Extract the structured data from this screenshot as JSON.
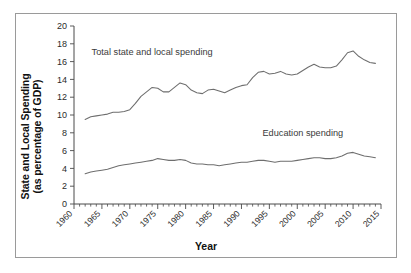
{
  "figure": {
    "frame_color": "#9a9a9a",
    "background": "#ffffff"
  },
  "axes": {
    "y_title_line1": "State and Local Spending",
    "y_title_line2": "(as percentage of GDP)",
    "x_title": "Year"
  },
  "annotations": {
    "total_label": "Total state and local spending",
    "education_label": "Education spending"
  },
  "chart_data": {
    "type": "line",
    "title": "",
    "xlabel": "Year",
    "ylabel": "State and Local Spending (as percentage of GDP)",
    "xlim": [
      1960,
      2015
    ],
    "ylim": [
      0,
      20
    ],
    "ytick_values": [
      0,
      2,
      4,
      6,
      8,
      10,
      12,
      14,
      16,
      18,
      20
    ],
    "ytick_labels": [
      "0",
      "2",
      "4",
      "6",
      "8",
      "10",
      "12",
      "14",
      "16",
      "18",
      "20"
    ],
    "xtick_values": [
      1960,
      1965,
      1970,
      1975,
      1980,
      1985,
      1990,
      1995,
      2000,
      2005,
      2010,
      2015
    ],
    "xtick_labels": [
      "1960",
      "1965",
      "1970",
      "1975",
      "1980",
      "1985",
      "1990",
      "1995",
      "2000",
      "2005",
      "2010",
      "2015"
    ],
    "xtick_rotation": 45,
    "x_minor_tick_step": 1,
    "grid": false,
    "legend": "inline-annotations",
    "line_color": "#6e6e6e",
    "x": [
      1962,
      1963,
      1964,
      1965,
      1966,
      1967,
      1968,
      1969,
      1970,
      1971,
      1972,
      1973,
      1974,
      1975,
      1976,
      1977,
      1978,
      1979,
      1980,
      1981,
      1982,
      1983,
      1984,
      1985,
      1986,
      1987,
      1988,
      1989,
      1990,
      1991,
      1992,
      1993,
      1994,
      1995,
      1996,
      1997,
      1998,
      1999,
      2000,
      2001,
      2002,
      2003,
      2004,
      2005,
      2006,
      2007,
      2008,
      2009,
      2010,
      2011,
      2012,
      2013,
      2014
    ],
    "series": [
      {
        "name": "Total state and local spending",
        "values": [
          9.5,
          9.8,
          9.9,
          10.0,
          10.1,
          10.3,
          10.3,
          10.4,
          10.6,
          11.3,
          12.1,
          12.6,
          13.1,
          13.0,
          12.6,
          12.6,
          13.1,
          13.6,
          13.4,
          12.8,
          12.5,
          12.4,
          12.8,
          12.9,
          12.7,
          12.5,
          12.8,
          13.1,
          13.3,
          13.4,
          14.2,
          14.8,
          14.9,
          14.6,
          14.7,
          14.9,
          14.6,
          14.5,
          14.6,
          15.0,
          15.4,
          15.7,
          15.4,
          15.3,
          15.3,
          15.5,
          16.2,
          17.0,
          17.2,
          16.6,
          16.2,
          15.9,
          15.8
        ]
      },
      {
        "name": "Education spending",
        "values": [
          3.4,
          3.6,
          3.7,
          3.8,
          3.9,
          4.1,
          4.3,
          4.4,
          4.5,
          4.6,
          4.7,
          4.8,
          4.9,
          5.1,
          5.0,
          4.9,
          4.9,
          5.0,
          4.9,
          4.6,
          4.5,
          4.5,
          4.4,
          4.4,
          4.3,
          4.4,
          4.5,
          4.6,
          4.7,
          4.7,
          4.8,
          4.9,
          4.9,
          4.8,
          4.7,
          4.8,
          4.8,
          4.8,
          4.9,
          5.0,
          5.1,
          5.2,
          5.2,
          5.1,
          5.1,
          5.2,
          5.4,
          5.7,
          5.8,
          5.6,
          5.4,
          5.3,
          5.2
        ]
      }
    ]
  }
}
